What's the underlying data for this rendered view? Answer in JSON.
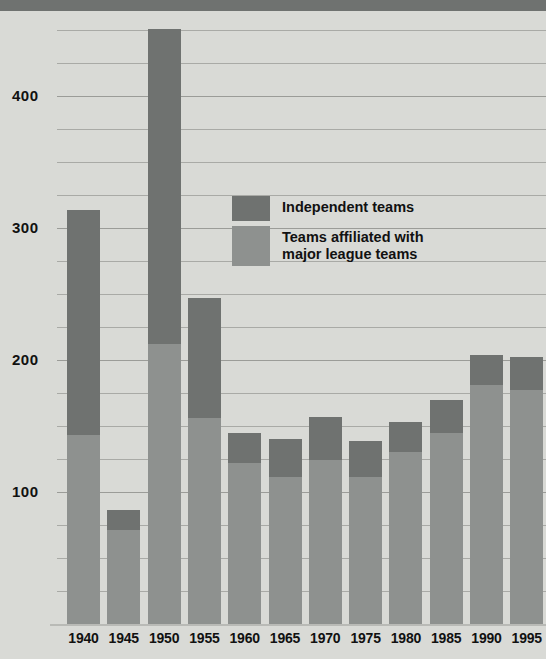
{
  "chart_data": {
    "type": "bar",
    "subtype": "stacked-vertical",
    "title": "",
    "xlabel": "",
    "ylabel": "",
    "ylim": [
      0,
      470
    ],
    "yticks": [
      100,
      200,
      300,
      400
    ],
    "ytick_labels": [
      "100",
      "200",
      "300",
      "400"
    ],
    "minor_gridline_step": 25,
    "grid": true,
    "legend_position": "inside-upper-center",
    "categories": [
      "1940",
      "1945",
      "1950",
      "1955",
      "1960",
      "1965",
      "1970",
      "1975",
      "1980",
      "1985",
      "1990",
      "1995"
    ],
    "series": [
      {
        "name": "Teams affiliated with major league teams",
        "color": "#8e918f",
        "values": [
          143,
          71,
          212,
          156,
          122,
          111,
          124,
          111,
          130,
          145,
          181,
          177
        ]
      },
      {
        "name": "Independent teams",
        "color": "#6f7270",
        "values": [
          171,
          15,
          239,
          91,
          23,
          29,
          33,
          28,
          23,
          25,
          23,
          25
        ]
      }
    ],
    "totals": [
      314,
      86,
      451,
      247,
      145,
      140,
      157,
      139,
      153,
      170,
      204,
      202
    ],
    "annotations": []
  },
  "legend": {
    "entries": [
      {
        "label": "Independent teams",
        "swatch": "dark"
      },
      {
        "label": "Teams affiliated with\nmajor league teams",
        "swatch": "light"
      }
    ]
  },
  "colors": {
    "background": "#d9dad6",
    "independent": "#6f7270",
    "affiliated": "#8e918f",
    "gridline": "#a9aaa6",
    "text": "#111111",
    "top_bar": "#6f7270"
  }
}
